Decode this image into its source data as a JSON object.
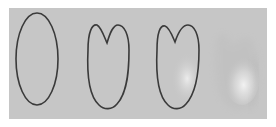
{
  "figure": {
    "background": "#c6c6c6",
    "outline_color": "#3a3a3a",
    "highlight_color": "#ececec",
    "shapes": [
      {
        "index": 1,
        "label": "ellipse-outline",
        "outlined": true,
        "notched": false,
        "shaded": false
      },
      {
        "index": 2,
        "label": "notched-outline",
        "outlined": true,
        "notched": true,
        "shaded": false
      },
      {
        "index": 3,
        "label": "notched-outline-shaded",
        "outlined": true,
        "notched": true,
        "shaded": true
      },
      {
        "index": 4,
        "label": "shaded-form",
        "outlined": false,
        "notched": true,
        "shaded": true
      }
    ]
  }
}
